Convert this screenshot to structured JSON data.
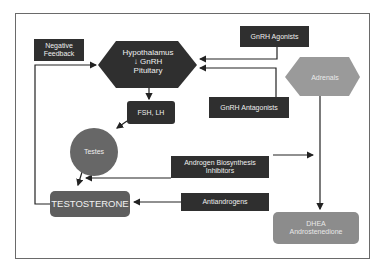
{
  "diagram": {
    "nodes": {
      "negative_feedback": "Negative\nFeedback",
      "hypothalamus": {
        "line1": "Hypothalamus",
        "arrow": "↓",
        "line2": "GnRH",
        "line3": "Pituitary"
      },
      "gnrh_agonists": "GnRH Agonists",
      "gnrh_antagonists": "GnRH Antagonists",
      "adrenals": "Adrenals",
      "fsh_lh": "FSH, LH",
      "testes": "Testes",
      "androgen_biosynthesis_inhibitors": {
        "line1": "Androgen Biosynthesis",
        "line2": "Inhibitors"
      },
      "testosterone": "TESTOSTERONE",
      "antiandrogens": "Antiandrogens",
      "dhea": {
        "line1": "DHEA",
        "line2": "Androstenedione"
      }
    },
    "edges": [
      {
        "from": "hypothalamus",
        "to": "fsh_lh"
      },
      {
        "from": "fsh_lh",
        "to": "testes"
      },
      {
        "from": "testes",
        "to": "testosterone"
      },
      {
        "from": "testosterone",
        "to": "hypothalamus",
        "label": "negative_feedback"
      },
      {
        "from": "gnrh_agonists",
        "to": "hypothalamus"
      },
      {
        "from": "gnrh_antagonists",
        "to": "hypothalamus"
      },
      {
        "from": "adrenals",
        "to": "dhea"
      },
      {
        "from": "androgen_biosynthesis_inhibitors",
        "to": "testes_output"
      },
      {
        "from": "androgen_biosynthesis_inhibitors",
        "to": "adrenals_output"
      },
      {
        "from": "antiandrogens",
        "to": "testosterone"
      }
    ],
    "colors": {
      "dark_box": "#2f2f2f",
      "testosterone_box": "#5e5e5e",
      "testes_circle": "#676767",
      "adrenals_hex": "#9a9a9a",
      "dhea_box": "#8c8c8c",
      "line": "#222222",
      "frame": "#6a6a6a"
    }
  }
}
